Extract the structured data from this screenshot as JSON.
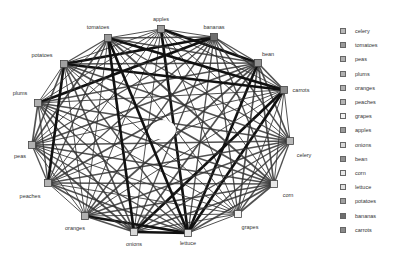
{
  "diagram": {
    "type": "circular-network-graph",
    "nodes": [
      {
        "name": "apples",
        "x": 161,
        "y": 29,
        "lx": 161,
        "ly": 19,
        "color": "#9a9a9a"
      },
      {
        "name": "bananas",
        "x": 214,
        "y": 37,
        "lx": 214,
        "ly": 27,
        "color": "#6e6e6e"
      },
      {
        "name": "bean",
        "x": 258,
        "y": 63,
        "lx": 268,
        "ly": 54,
        "color": "#909090"
      },
      {
        "name": "carrots",
        "x": 284,
        "y": 90,
        "lx": 301,
        "ly": 90,
        "color": "#8a8a8a"
      },
      {
        "name": "celery",
        "x": 290,
        "y": 141,
        "lx": 304,
        "ly": 155,
        "color": "#b8b8b8"
      },
      {
        "name": "corn",
        "x": 274,
        "y": 184,
        "lx": 288,
        "ly": 195,
        "color": "#e8e8e8"
      },
      {
        "name": "grapes",
        "x": 238,
        "y": 214,
        "lx": 250,
        "ly": 227,
        "color": "#f2f2f2"
      },
      {
        "name": "lettuce",
        "x": 188,
        "y": 233,
        "lx": 188,
        "ly": 243,
        "color": "#e0e0e0"
      },
      {
        "name": "onions",
        "x": 134,
        "y": 232,
        "lx": 134,
        "ly": 244,
        "color": "#d8d8d8"
      },
      {
        "name": "oranges",
        "x": 85,
        "y": 216,
        "lx": 75,
        "ly": 228,
        "color": "#b0b0b0"
      },
      {
        "name": "peaches",
        "x": 48,
        "y": 183,
        "lx": 30,
        "ly": 196,
        "color": "#b4b4b4"
      },
      {
        "name": "peas",
        "x": 32,
        "y": 145,
        "lx": 20,
        "ly": 156,
        "color": "#b0b0b0"
      },
      {
        "name": "plums",
        "x": 38,
        "y": 103,
        "lx": 20,
        "ly": 93,
        "color": "#b0b0b0"
      },
      {
        "name": "potatoes",
        "x": 64,
        "y": 64,
        "lx": 42,
        "ly": 55,
        "color": "#a0a0a0"
      },
      {
        "name": "tomatoes",
        "x": 108,
        "y": 38,
        "lx": 98,
        "ly": 27,
        "color": "#9a9a9a"
      }
    ],
    "thick_edges": [
      [
        "tomatoes",
        "lettuce"
      ],
      [
        "apples",
        "lettuce"
      ],
      [
        "bean",
        "lettuce"
      ],
      [
        "carrots",
        "lettuce"
      ],
      [
        "potatoes",
        "carrots"
      ],
      [
        "tomatoes",
        "carrots"
      ],
      [
        "apples",
        "bean"
      ],
      [
        "potatoes",
        "bananas"
      ],
      [
        "carrots",
        "onions"
      ],
      [
        "plums",
        "bananas"
      ],
      [
        "lettuce",
        "onions"
      ],
      [
        "oranges",
        "lettuce"
      ],
      [
        "potatoes",
        "peaches"
      ],
      [
        "tomatoes",
        "onions"
      ]
    ],
    "center_hole": {
      "x": 163,
      "y": 130,
      "rx": 13,
      "ry": 10
    }
  },
  "legend": {
    "items": [
      {
        "label": "celery",
        "color": "#b8b8b8"
      },
      {
        "label": "tomatoes",
        "color": "#9a9a9a"
      },
      {
        "label": "peas",
        "color": "#b0b0b0"
      },
      {
        "label": "plums",
        "color": "#b0b0b0"
      },
      {
        "label": "oranges",
        "color": "#b0b0b0"
      },
      {
        "label": "peaches",
        "color": "#b4b4b4"
      },
      {
        "label": "grapes",
        "color": "#f2f2f2"
      },
      {
        "label": "apples",
        "color": "#9a9a9a"
      },
      {
        "label": "onions",
        "color": "#d8d8d8"
      },
      {
        "label": "bean",
        "color": "#909090"
      },
      {
        "label": "corn",
        "color": "#e8e8e8"
      },
      {
        "label": "lettuce",
        "color": "#e0e0e0"
      },
      {
        "label": "potatoes",
        "color": "#a0a0a0"
      },
      {
        "label": "bananas",
        "color": "#6e6e6e"
      },
      {
        "label": "carrots",
        "color": "#8a8a8a"
      }
    ]
  }
}
